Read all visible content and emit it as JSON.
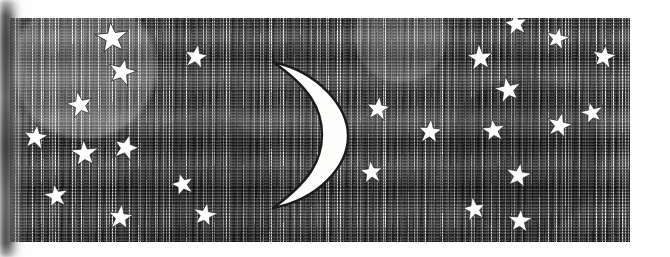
{
  "artwork": {
    "title": "Night Sky with Crescent Moon and Stars",
    "medium": "pen-and-ink engraving / cross-hatch illustration",
    "alt_text": "A rectangular panel of dense horizontal hatching representing a night sky, with a white crescent moon at center-left and many white five-pointed stars scattered across it.",
    "colors": {
      "page_background": "#fefefe",
      "sky_ink": "#1b1b1b",
      "sky_midtone": "#8e8e8e",
      "highlight": "#fdfdfc",
      "panel_border": "#2a2a2a",
      "scan_shadow": "#3c3c3c"
    }
  },
  "panel": {
    "x": 10,
    "y": 18,
    "width": 620,
    "height": 224,
    "border_width": 1
  },
  "moon": {
    "name": "crescent-moon",
    "phase": "waning crescent",
    "opening_direction": "left",
    "x": 243,
    "y": 58,
    "width": 107,
    "height": 154
  },
  "stars": [
    {
      "id": "star-01",
      "x": 112,
      "y": 38,
      "size": 34,
      "rotation": -6
    },
    {
      "id": "star-02",
      "x": 196,
      "y": 57,
      "size": 26,
      "rotation": 10
    },
    {
      "id": "star-03",
      "x": 122,
      "y": 72,
      "size": 30,
      "rotation": 14
    },
    {
      "id": "star-04",
      "x": 80,
      "y": 105,
      "size": 28,
      "rotation": -12
    },
    {
      "id": "star-05",
      "x": 35,
      "y": 137,
      "size": 27,
      "rotation": 8
    },
    {
      "id": "star-06",
      "x": 84,
      "y": 153,
      "size": 29,
      "rotation": -4
    },
    {
      "id": "star-07",
      "x": 126,
      "y": 148,
      "size": 28,
      "rotation": 16
    },
    {
      "id": "star-08",
      "x": 56,
      "y": 196,
      "size": 26,
      "rotation": -9
    },
    {
      "id": "star-09",
      "x": 120,
      "y": 217,
      "size": 27,
      "rotation": 6
    },
    {
      "id": "star-10",
      "x": 182,
      "y": 184,
      "size": 25,
      "rotation": -15
    },
    {
      "id": "star-11",
      "x": 205,
      "y": 215,
      "size": 26,
      "rotation": 11
    },
    {
      "id": "star-12",
      "x": 516,
      "y": 24,
      "size": 26,
      "rotation": -8
    },
    {
      "id": "star-13",
      "x": 557,
      "y": 38,
      "size": 25,
      "rotation": 12
    },
    {
      "id": "star-14",
      "x": 480,
      "y": 58,
      "size": 28,
      "rotation": -5
    },
    {
      "id": "star-15",
      "x": 604,
      "y": 57,
      "size": 26,
      "rotation": 9
    },
    {
      "id": "star-16",
      "x": 508,
      "y": 90,
      "size": 28,
      "rotation": -11
    },
    {
      "id": "star-17",
      "x": 378,
      "y": 109,
      "size": 26,
      "rotation": 7
    },
    {
      "id": "star-18",
      "x": 592,
      "y": 113,
      "size": 24,
      "rotation": -13
    },
    {
      "id": "star-19",
      "x": 430,
      "y": 132,
      "size": 26,
      "rotation": 5
    },
    {
      "id": "star-20",
      "x": 493,
      "y": 130,
      "size": 25,
      "rotation": -7
    },
    {
      "id": "star-21",
      "x": 559,
      "y": 125,
      "size": 27,
      "rotation": 13
    },
    {
      "id": "star-22",
      "x": 371,
      "y": 172,
      "size": 25,
      "rotation": -6
    },
    {
      "id": "star-23",
      "x": 518,
      "y": 175,
      "size": 27,
      "rotation": 10
    },
    {
      "id": "star-24",
      "x": 474,
      "y": 209,
      "size": 25,
      "rotation": -10
    },
    {
      "id": "star-25",
      "x": 520,
      "y": 221,
      "size": 26,
      "rotation": 4
    }
  ],
  "scan_artifacts": {
    "left_binding_shadow": {
      "name": "left-binding-shadow",
      "x": 0,
      "width": 26
    }
  }
}
